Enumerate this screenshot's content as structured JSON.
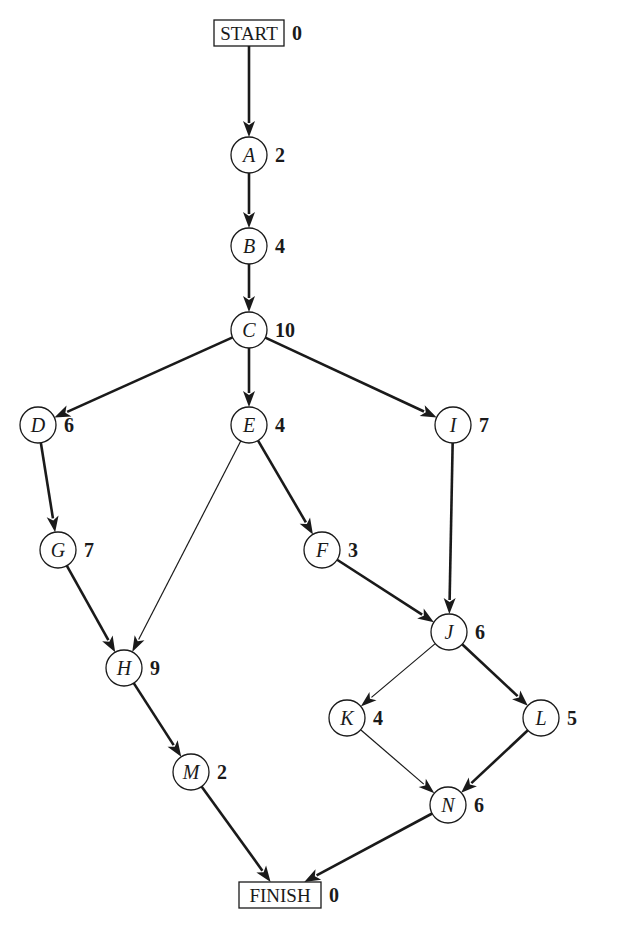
{
  "diagram": {
    "type": "activity-network",
    "colors": {
      "ink": "#1a1a1a",
      "background": "#ffffff"
    },
    "terminals": [
      {
        "id": "START",
        "label": "START",
        "duration": "0",
        "x": 249,
        "y": 33,
        "w": 70,
        "h": 26
      },
      {
        "id": "FINISH",
        "label": "FINISH",
        "duration": "0",
        "x": 280,
        "y": 895,
        "w": 82,
        "h": 26
      }
    ],
    "nodes": [
      {
        "id": "A",
        "label": "A",
        "duration": "2",
        "x": 249,
        "y": 155
      },
      {
        "id": "B",
        "label": "B",
        "duration": "4",
        "x": 249,
        "y": 246
      },
      {
        "id": "C",
        "label": "C",
        "duration": "10",
        "x": 249,
        "y": 330
      },
      {
        "id": "D",
        "label": "D",
        "duration": "6",
        "x": 38,
        "y": 425
      },
      {
        "id": "E",
        "label": "E",
        "duration": "4",
        "x": 249,
        "y": 425
      },
      {
        "id": "I",
        "label": "I",
        "duration": "7",
        "x": 453,
        "y": 425
      },
      {
        "id": "G",
        "label": "G",
        "duration": "7",
        "x": 58,
        "y": 550
      },
      {
        "id": "F",
        "label": "F",
        "duration": "3",
        "x": 322,
        "y": 550
      },
      {
        "id": "J",
        "label": "J",
        "duration": "6",
        "x": 449,
        "y": 632
      },
      {
        "id": "H",
        "label": "H",
        "duration": "9",
        "x": 124,
        "y": 668
      },
      {
        "id": "K",
        "label": "K",
        "duration": "4",
        "x": 347,
        "y": 718
      },
      {
        "id": "L",
        "label": "L",
        "duration": "5",
        "x": 541,
        "y": 718
      },
      {
        "id": "M",
        "label": "M",
        "duration": "2",
        "x": 191,
        "y": 772
      },
      {
        "id": "N",
        "label": "N",
        "duration": "6",
        "x": 448,
        "y": 805
      }
    ],
    "edges": [
      {
        "from": "START",
        "to": "A",
        "weight": "thick"
      },
      {
        "from": "A",
        "to": "B",
        "weight": "thick"
      },
      {
        "from": "B",
        "to": "C",
        "weight": "thick"
      },
      {
        "from": "C",
        "to": "D",
        "weight": "thick"
      },
      {
        "from": "C",
        "to": "E",
        "weight": "thick"
      },
      {
        "from": "C",
        "to": "I",
        "weight": "thick"
      },
      {
        "from": "D",
        "to": "G",
        "weight": "thick"
      },
      {
        "from": "E",
        "to": "H",
        "weight": "thin"
      },
      {
        "from": "E",
        "to": "F",
        "weight": "thick"
      },
      {
        "from": "I",
        "to": "J",
        "weight": "thick"
      },
      {
        "from": "G",
        "to": "H",
        "weight": "thick"
      },
      {
        "from": "F",
        "to": "J",
        "weight": "thick"
      },
      {
        "from": "J",
        "to": "K",
        "weight": "thin"
      },
      {
        "from": "J",
        "to": "L",
        "weight": "thick"
      },
      {
        "from": "H",
        "to": "M",
        "weight": "thick"
      },
      {
        "from": "K",
        "to": "N",
        "weight": "thin"
      },
      {
        "from": "L",
        "to": "N",
        "weight": "thick"
      },
      {
        "from": "M",
        "to": "FINISH",
        "weight": "thick"
      },
      {
        "from": "N",
        "to": "FINISH",
        "weight": "thick"
      }
    ]
  }
}
